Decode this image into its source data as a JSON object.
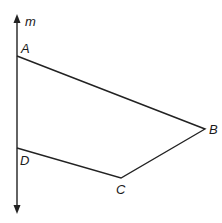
{
  "diagram": {
    "type": "geometry-figure",
    "line": {
      "label": "m",
      "x": 17,
      "y_top": 15,
      "y_bottom": 213,
      "color": "#222222"
    },
    "quadrilateral": {
      "name": "ABCD",
      "stroke": "#222222",
      "vertices": [
        {
          "name": "A",
          "x": 17,
          "y": 56,
          "label_x": 21,
          "label_y": 53
        },
        {
          "name": "B",
          "x": 205,
          "y": 129,
          "label_x": 209,
          "label_y": 134
        },
        {
          "name": "C",
          "x": 121,
          "y": 178,
          "label_x": 116,
          "label_y": 194
        },
        {
          "name": "D",
          "x": 17,
          "y": 148,
          "label_x": 20,
          "label_y": 165
        }
      ]
    }
  },
  "labels": {
    "m": "m",
    "A": "A",
    "B": "B",
    "C": "C",
    "D": "D"
  }
}
